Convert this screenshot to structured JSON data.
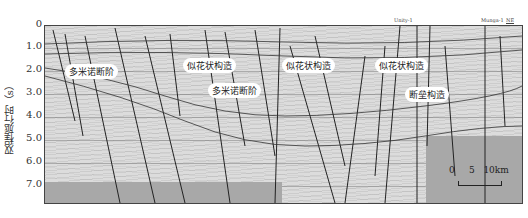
{
  "figure": {
    "y_axis_label": "双程旅行时（s）",
    "y_ticks": [
      "0",
      "1.0",
      "2.0",
      "3.0",
      "4.0",
      "5.0",
      "6.0",
      "7.0"
    ],
    "wells": [
      "Unity-1",
      "Munga-1"
    ],
    "direction": "NE",
    "annotations": [
      "多米诺断阶",
      "似花状构造",
      "多米诺断阶",
      "似花状构造",
      "似花状构造",
      "断垒构造"
    ],
    "scale_bar": {
      "labels": [
        "0",
        "5",
        "10km"
      ]
    }
  }
}
